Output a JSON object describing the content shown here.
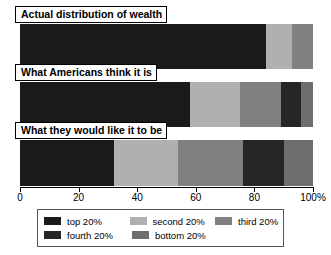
{
  "chart_data": {
    "type": "bar",
    "orientation": "horizontal",
    "stacked": true,
    "title": "",
    "xlabel": "",
    "ylabel": "",
    "xlim": [
      0,
      100
    ],
    "grid": false,
    "legend_position": "bottom",
    "categories": [
      "Actual distribution of wealth",
      "What Americans think it is",
      "What they would like it to be"
    ],
    "tick_labels": [
      "0",
      "20",
      "40",
      "60",
      "80",
      "100%"
    ],
    "tick_values": [
      0,
      20,
      40,
      60,
      80,
      100
    ],
    "series": [
      {
        "name": "top 20%",
        "color": "#1a1a1a",
        "values": [
          84,
          58,
          32
        ]
      },
      {
        "name": "second 20%",
        "color": "#b0b0b0",
        "values": [
          9,
          17,
          22
        ]
      },
      {
        "name": "third 20%",
        "color": "#808080",
        "values": [
          7,
          14,
          22
        ]
      },
      {
        "name": "fourth 20%",
        "color": "#262626",
        "values": [
          0,
          7,
          14
        ]
      },
      {
        "name": "bottom 20%",
        "color": "#6e6e6e",
        "values": [
          0,
          4,
          10
        ]
      }
    ]
  },
  "legend": {
    "rows": [
      [
        {
          "label": "top 20%",
          "color": "#1a1a1a"
        },
        {
          "label": "second 20%",
          "color": "#b0b0b0"
        },
        {
          "label": "third 20%",
          "color": "#808080"
        }
      ],
      [
        {
          "label": "fourth 20%",
          "color": "#262626"
        },
        {
          "label": "bottom 20%",
          "color": "#6e6e6e"
        }
      ]
    ]
  }
}
